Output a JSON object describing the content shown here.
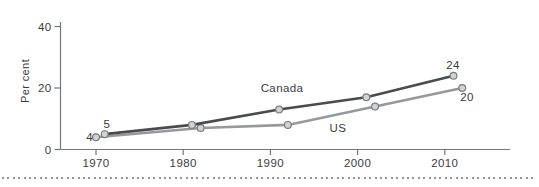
{
  "chart_data": {
    "type": "line",
    "title": "",
    "xlabel": "",
    "ylabel": "Per cent",
    "x_ticks": [
      1970,
      1980,
      1990,
      2000,
      2010
    ],
    "y_ticks": [
      0,
      20,
      40
    ],
    "xlim": [
      1965.9,
      2017.5
    ],
    "ylim": [
      0,
      41.5
    ],
    "grid": false,
    "legend": "inline-labels",
    "series": [
      {
        "name": "Canada",
        "color": "#4a4b4d",
        "x": [
          1971,
          1981,
          1991,
          2001,
          2011
        ],
        "values": [
          5,
          8,
          13,
          17,
          24
        ]
      },
      {
        "name": "US",
        "color": "#96989b",
        "x": [
          1970,
          1982,
          1992,
          2002,
          2012
        ],
        "values": [
          4,
          7,
          8,
          14,
          20
        ]
      }
    ],
    "series_labels": [
      {
        "text": "Canada",
        "px": 282,
        "py": 92,
        "anchor": "middle"
      },
      {
        "text": "US",
        "px": 338,
        "py": 132,
        "anchor": "middle"
      }
    ],
    "point_labels": [
      {
        "text": "4",
        "px": 93,
        "py": 141,
        "anchor": "end"
      },
      {
        "text": "5",
        "px": 107,
        "py": 128,
        "anchor": "middle"
      },
      {
        "text": "24",
        "px": 453,
        "py": 69,
        "anchor": "middle"
      },
      {
        "text": "20",
        "px": 467,
        "py": 101,
        "anchor": "middle"
      }
    ],
    "marker": {
      "fill": "#d0d2d3",
      "stroke": "#7a7c7f"
    },
    "axis_color": "#76777a",
    "text_color": "#3b3b3d"
  },
  "separator": {
    "style": "dotted"
  }
}
